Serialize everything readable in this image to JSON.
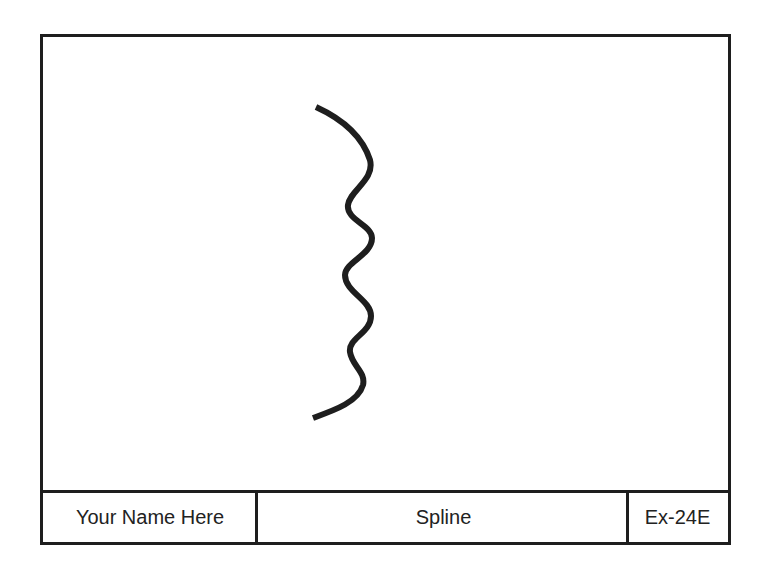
{
  "drawing": {
    "type": "spline",
    "stroke_color": "#1e1e1e",
    "background": "#ffffff"
  },
  "title_block": {
    "name_field": "Your Name Here",
    "title_field": "Spline",
    "code_field": "Ex-24E"
  }
}
